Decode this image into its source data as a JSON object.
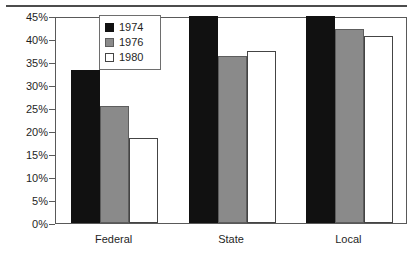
{
  "chart_data": {
    "type": "bar",
    "title": "",
    "subtitle": "",
    "xlabel": "",
    "ylabel": "",
    "categories": [
      "Federal",
      "State",
      "Local"
    ],
    "series": [
      {
        "name": "1974",
        "color": "#111111",
        "values": [
          33.3,
          45.0,
          45.0
        ]
      },
      {
        "name": "1976",
        "color": "#8a8a8a",
        "values": [
          25.5,
          36.3,
          42.2
        ]
      },
      {
        "name": "1980",
        "color": "#ffffff",
        "values": [
          18.5,
          37.3,
          40.7
        ]
      }
    ],
    "ylim": [
      0,
      45
    ],
    "y_tick_labels": [
      "0%",
      "5%",
      "10%",
      "15%",
      "20%",
      "25%",
      "30%",
      "35%",
      "40%",
      "45%"
    ],
    "y_tick_values": [
      0,
      5,
      10,
      15,
      20,
      25,
      30,
      35,
      40,
      45
    ],
    "grid": false,
    "legend_position": "top-center",
    "legend_entries": [
      "1974",
      "1976",
      "1980"
    ],
    "annotations": []
  },
  "decor": {
    "top_rule": "horizontal-rule"
  }
}
